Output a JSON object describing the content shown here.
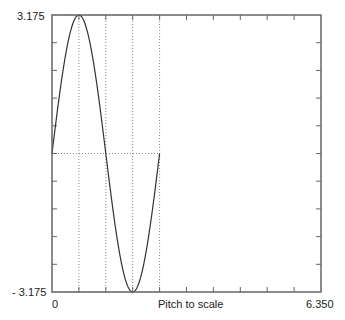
{
  "chart_data": {
    "type": "line",
    "title": "",
    "xlabel": "Pitch to scale",
    "ylabel": "",
    "xlim": [
      0,
      6.35
    ],
    "ylim": [
      -3.175,
      3.175
    ],
    "x_tick_labels": [
      "0",
      "6.350"
    ],
    "y_tick_labels": [
      "3.175",
      "- 3.175"
    ],
    "grid": false,
    "series": [
      {
        "name": "sine profile",
        "x": [
          0,
          0.635,
          1.27,
          1.905,
          2.54
        ],
        "y": [
          0,
          3.175,
          0,
          -3.175,
          0
        ]
      }
    ],
    "reference_lines": {
      "horizontal": [
        3.175,
        0,
        -3.175
      ],
      "vertical": [
        0.635,
        1.27,
        1.905,
        2.54
      ],
      "style": "dotted"
    },
    "ticks": {
      "x_count": 10,
      "y_count": 10
    }
  },
  "labels": {
    "y_max": "3.175",
    "y_min": "- 3.175",
    "x_min": "0",
    "x_max": "6.350",
    "x_axis_title": "Pitch to scale"
  },
  "colors": {
    "frame": "#666666",
    "curve": "#333333",
    "dotted": "#888888",
    "text": "#222222"
  }
}
